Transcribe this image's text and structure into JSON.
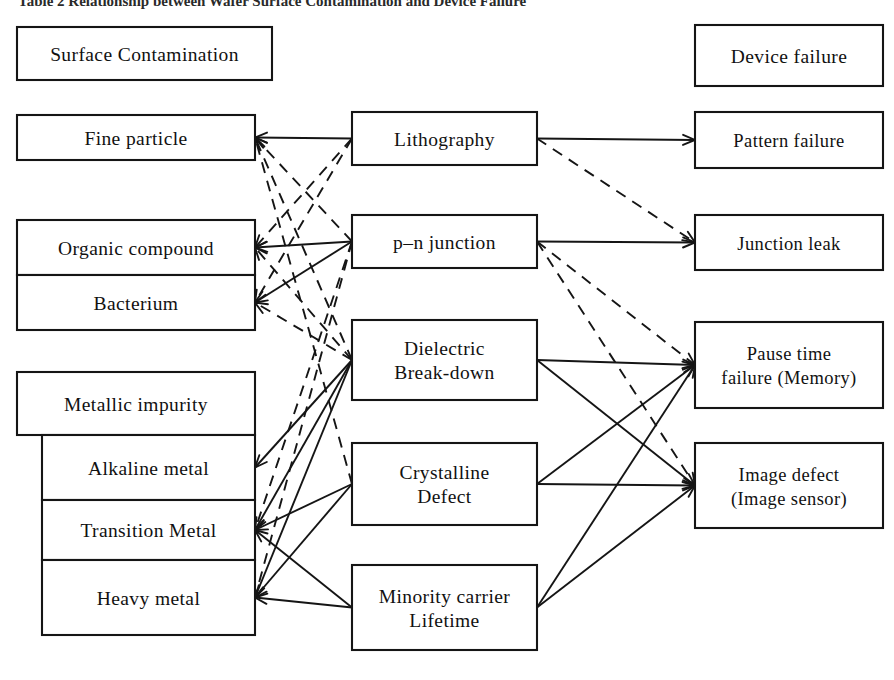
{
  "figure": {
    "title": "Table 2   Relationship between Wafer Surface Contamination and Device Failure",
    "title_clipped": true,
    "background_color": "#ffffff",
    "line_color": "#151515"
  },
  "columns": {
    "left_header": "Surface Contamination",
    "right_header": "Device failure"
  },
  "contaminants": [
    {
      "id": "fine-particle",
      "label": "Fine particle",
      "x": 17,
      "y": 115,
      "w": 238,
      "h": 45,
      "nested": false
    },
    {
      "id": "organic-compound",
      "label": "Organic compound",
      "x": 17,
      "y": 220,
      "w": 238,
      "h": 55,
      "nested": false
    },
    {
      "id": "bacterium",
      "label": "Bacterium",
      "x": 17,
      "y": 275,
      "w": 238,
      "h": 55,
      "nested": false
    },
    {
      "id": "metallic-impurity",
      "label": "Metallic impurity",
      "x": 17,
      "y": 372,
      "w": 238,
      "h": 63,
      "nested": false
    },
    {
      "id": "alkaline-metal",
      "label": "Alkaline metal",
      "x": 42,
      "y": 435,
      "w": 213,
      "h": 65,
      "nested": true
    },
    {
      "id": "transition-metal",
      "label": "Transition Metal",
      "x": 42,
      "y": 500,
      "w": 213,
      "h": 60,
      "nested": true
    },
    {
      "id": "heavy-metal",
      "label": "Heavy metal",
      "x": 42,
      "y": 560,
      "w": 213,
      "h": 75,
      "nested": true
    }
  ],
  "mechanisms": [
    {
      "id": "lithography",
      "lines": [
        "Lithography"
      ],
      "x": 352,
      "y": 112,
      "w": 185,
      "h": 53
    },
    {
      "id": "pn-junction",
      "lines": [
        "p–n junction"
      ],
      "x": 352,
      "y": 215,
      "w": 185,
      "h": 53
    },
    {
      "id": "dielectric",
      "lines": [
        "Dielectric",
        "Break-down"
      ],
      "x": 352,
      "y": 320,
      "w": 185,
      "h": 80
    },
    {
      "id": "crystalline-defect",
      "lines": [
        "Crystalline",
        "Defect"
      ],
      "x": 352,
      "y": 443,
      "w": 185,
      "h": 82
    },
    {
      "id": "minority-carrier",
      "lines": [
        "Minority carrier",
        "Lifetime"
      ],
      "x": 352,
      "y": 565,
      "w": 185,
      "h": 85
    }
  ],
  "failures": [
    {
      "id": "pattern-failure",
      "lines": [
        "Pattern failure"
      ],
      "x": 695,
      "y": 112,
      "w": 188,
      "h": 56
    },
    {
      "id": "junction-leak",
      "lines": [
        "Junction leak"
      ],
      "x": 695,
      "y": 215,
      "w": 188,
      "h": 55
    },
    {
      "id": "pause-time",
      "lines": [
        "Pause time",
        "failure (Memory)"
      ],
      "x": 695,
      "y": 322,
      "w": 188,
      "h": 86
    },
    {
      "id": "image-defect",
      "lines": [
        "Image defect",
        "(Image sensor)"
      ],
      "x": 695,
      "y": 443,
      "w": 188,
      "h": 85
    }
  ],
  "headers": [
    {
      "id": "surface-contamination",
      "label": "Surface Contamination",
      "x": 17,
      "y": 27,
      "w": 255,
      "h": 53
    },
    {
      "id": "device-failure",
      "label": "Device failure",
      "x": 695,
      "y": 25,
      "w": 188,
      "h": 61
    }
  ],
  "links_left": [
    {
      "from": "lithography",
      "to": "fine-particle",
      "style": "solid"
    },
    {
      "from": "pn-junction",
      "to": "fine-particle",
      "style": "dashed"
    },
    {
      "from": "dielectric",
      "to": "fine-particle",
      "style": "dashed"
    },
    {
      "from": "crystalline-defect",
      "to": "fine-particle",
      "style": "dashed"
    },
    {
      "from": "lithography",
      "to": "organic-compound",
      "style": "dashed"
    },
    {
      "from": "pn-junction",
      "to": "organic-compound",
      "style": "solid"
    },
    {
      "from": "dielectric",
      "to": "organic-compound",
      "style": "dashed"
    },
    {
      "from": "lithography",
      "to": "bacterium",
      "style": "dashed"
    },
    {
      "from": "pn-junction",
      "to": "bacterium",
      "style": "solid"
    },
    {
      "from": "dielectric",
      "to": "bacterium",
      "style": "dashed"
    },
    {
      "from": "dielectric",
      "to": "alkaline-metal",
      "style": "solid"
    },
    {
      "from": "dielectric",
      "to": "transition-metal",
      "style": "solid"
    },
    {
      "from": "crystalline-defect",
      "to": "transition-metal",
      "style": "solid"
    },
    {
      "from": "minority-carrier",
      "to": "transition-metal",
      "style": "solid"
    },
    {
      "from": "dielectric",
      "to": "heavy-metal",
      "style": "solid"
    },
    {
      "from": "crystalline-defect",
      "to": "heavy-metal",
      "style": "solid"
    },
    {
      "from": "minority-carrier",
      "to": "heavy-metal",
      "style": "solid"
    },
    {
      "from": "pn-junction",
      "to": "transition-metal",
      "style": "dashed"
    },
    {
      "from": "pn-junction",
      "to": "heavy-metal",
      "style": "dashed"
    }
  ],
  "links_right": [
    {
      "from": "lithography",
      "to": "pattern-failure",
      "style": "solid"
    },
    {
      "from": "lithography",
      "to": "junction-leak",
      "style": "dashed"
    },
    {
      "from": "pn-junction",
      "to": "junction-leak",
      "style": "solid"
    },
    {
      "from": "pn-junction",
      "to": "pause-time",
      "style": "dashed"
    },
    {
      "from": "pn-junction",
      "to": "image-defect",
      "style": "dashed"
    },
    {
      "from": "dielectric",
      "to": "pause-time",
      "style": "solid"
    },
    {
      "from": "dielectric",
      "to": "image-defect",
      "style": "solid"
    },
    {
      "from": "crystalline-defect",
      "to": "pause-time",
      "style": "solid"
    },
    {
      "from": "crystalline-defect",
      "to": "image-defect",
      "style": "solid"
    },
    {
      "from": "minority-carrier",
      "to": "pause-time",
      "style": "solid"
    },
    {
      "from": "minority-carrier",
      "to": "image-defect",
      "style": "solid"
    }
  ]
}
